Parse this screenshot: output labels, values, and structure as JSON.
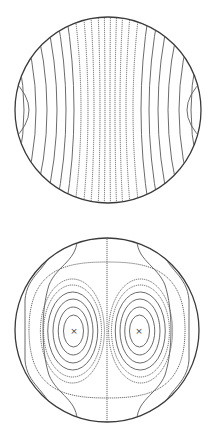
{
  "figure": {
    "panels": [
      {
        "id": "top",
        "description": "parallel curved contour lines across a circular domain",
        "cx": 108,
        "cy": 110,
        "r": 93,
        "line_color": "#5a5a5a",
        "boundary_color": "#3a3a3a"
      },
      {
        "id": "bottom",
        "description": "two counter-rotating cells with x-marked centers, vertical dotted symmetry line",
        "cx": 107,
        "cy": 330,
        "r": 92,
        "centers": [
          {
            "x": 74,
            "y": 331,
            "label": "×"
          },
          {
            "x": 139,
            "y": 331,
            "label": "×"
          }
        ],
        "line_color": "#5a5a5a",
        "boundary_color": "#3a3a3a"
      }
    ],
    "markers": {
      "left": "×",
      "right": "×"
    }
  }
}
